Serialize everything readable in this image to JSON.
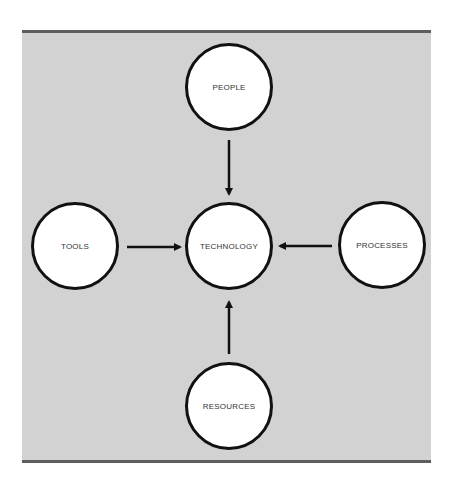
{
  "diagram": {
    "colors": {
      "panel_background": "#d2d2d2",
      "panel_border": "#5e5e5e",
      "node_fill": "#ffffff",
      "node_stroke": "#111111",
      "arrow": "#111111"
    },
    "center": {
      "label": "TECHNOLOGY"
    },
    "nodes": [
      {
        "id": "people",
        "label": "PEOPLE",
        "position": "top"
      },
      {
        "id": "tools",
        "label": "TOOLS",
        "position": "left"
      },
      {
        "id": "processes",
        "label": "PROCESSES",
        "position": "right"
      },
      {
        "id": "resources",
        "label": "RESOURCES",
        "position": "bottom"
      }
    ],
    "edges": [
      {
        "from": "PEOPLE",
        "to": "TECHNOLOGY"
      },
      {
        "from": "TOOLS",
        "to": "TECHNOLOGY"
      },
      {
        "from": "PROCESSES",
        "to": "TECHNOLOGY"
      },
      {
        "from": "RESOURCES",
        "to": "TECHNOLOGY"
      }
    ]
  }
}
